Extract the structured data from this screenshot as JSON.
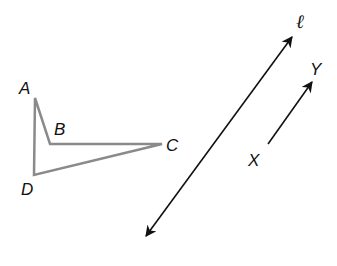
{
  "figure": {
    "quadrilateral": {
      "vertices": [
        {
          "label": "A",
          "x": 35,
          "y": 98,
          "lx": 19,
          "ly": 94
        },
        {
          "label": "B",
          "x": 50,
          "y": 144,
          "lx": 54,
          "ly": 135
        },
        {
          "label": "C",
          "x": 162,
          "y": 144,
          "lx": 166,
          "ly": 151
        },
        {
          "label": "D",
          "x": 34,
          "y": 175,
          "lx": 21,
          "ly": 195
        }
      ],
      "stroke": "#8a8a8a"
    },
    "line_l": {
      "label": "ℓ",
      "x1": 146,
      "y1": 236,
      "x2": 292,
      "y2": 37,
      "lx": 296,
      "ly": 28,
      "stroke": "#111111"
    },
    "ray_xy": {
      "start_label": "X",
      "end_label": "Y",
      "x1": 268,
      "y1": 144,
      "x2": 312,
      "y2": 82,
      "start_lx": 248,
      "start_ly": 166,
      "end_lx": 310,
      "end_ly": 75,
      "stroke": "#111111"
    }
  }
}
